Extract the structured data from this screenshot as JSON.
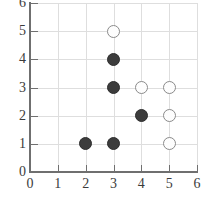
{
  "figure": {
    "type": "scatter-grid-plot",
    "background_color": "#ffffff",
    "axis_color": "#6f6f6f",
    "grid_color": "#dedede",
    "filled_marker_color": "#3c3c3c",
    "open_marker_color": "#fdfdfd",
    "open_marker_border_color": "#8a8a8a"
  },
  "chart_data": {
    "type": "scatter",
    "title": "",
    "xlabel": "",
    "ylabel": "",
    "xlim": [
      0,
      6
    ],
    "ylim": [
      0,
      6
    ],
    "xticks": [
      0,
      1,
      2,
      3,
      4,
      5,
      6
    ],
    "yticks": [
      0,
      1,
      2,
      3,
      4,
      5,
      6
    ],
    "xtick_labels": [
      "0",
      "1",
      "2",
      "3",
      "4",
      "5",
      "6"
    ],
    "ytick_labels": [
      "0",
      "1",
      "2",
      "3",
      "4",
      "5",
      "6"
    ],
    "grid": true,
    "legend": null,
    "series": [
      {
        "name": "filled",
        "marker": "filled-circle",
        "color": "#3c3c3c",
        "points": [
          {
            "x": 2,
            "y": 1
          },
          {
            "x": 3,
            "y": 1
          },
          {
            "x": 3,
            "y": 3
          },
          {
            "x": 3,
            "y": 4
          },
          {
            "x": 4,
            "y": 2
          }
        ]
      },
      {
        "name": "open",
        "marker": "open-circle",
        "color": "#fdfdfd",
        "points": [
          {
            "x": 3,
            "y": 5
          },
          {
            "x": 4,
            "y": 3
          },
          {
            "x": 5,
            "y": 3
          },
          {
            "x": 5,
            "y": 2
          },
          {
            "x": 5,
            "y": 1
          }
        ]
      }
    ]
  }
}
